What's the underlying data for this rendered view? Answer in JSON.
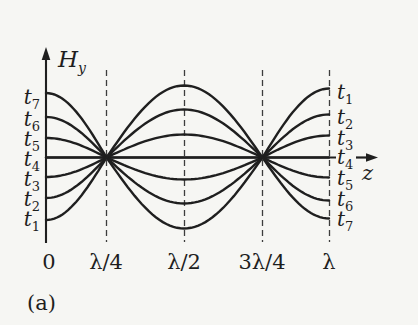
{
  "figure": {
    "panel_label": "(a)",
    "y_axis_label": {
      "base": "H",
      "sub": "y"
    },
    "x_axis_label": "z",
    "x_ticks": [
      {
        "label": "0",
        "x_px": 49
      },
      {
        "label": "λ/4",
        "x_px": 106
      },
      {
        "label": "λ/2",
        "x_px": 184
      },
      {
        "label": "3λ/4",
        "x_px": 262
      },
      {
        "label": "λ",
        "x_px": 329
      }
    ],
    "left_time_labels": [
      {
        "base": "t",
        "sub": "7",
        "y_px": 97
      },
      {
        "base": "t",
        "sub": "6",
        "y_px": 119
      },
      {
        "base": "t",
        "sub": "5",
        "y_px": 139
      },
      {
        "base": "t",
        "sub": "4",
        "y_px": 159
      },
      {
        "base": "t",
        "sub": "3",
        "y_px": 179
      },
      {
        "base": "t",
        "sub": "2",
        "y_px": 199
      },
      {
        "base": "t",
        "sub": "1",
        "y_px": 219
      }
    ],
    "right_time_labels": [
      {
        "base": "t",
        "sub": "1",
        "y_px": 92
      },
      {
        "base": "t",
        "sub": "2",
        "y_px": 117
      },
      {
        "base": "t",
        "sub": "3",
        "y_px": 138
      },
      {
        "base": "t",
        "sub": "4",
        "y_px": 157
      },
      {
        "base": "t",
        "sub": "5",
        "y_px": 178
      },
      {
        "base": "t",
        "sub": "6",
        "y_px": 199
      },
      {
        "base": "t",
        "sub": "7",
        "y_px": 219
      }
    ]
  },
  "chart_data": {
    "type": "line",
    "xlabel": "z",
    "ylabel": "Hy",
    "x_axis_ticks": [
      "0",
      "λ/4",
      "λ/2",
      "3λ/4",
      "λ"
    ],
    "node_positions": [
      "λ/4",
      "3λ/4"
    ],
    "antinode_positions": [
      "0",
      "λ/2",
      "λ"
    ],
    "waveform": "Hy(z,t_k) = A_k · cos(2πz/λ)",
    "grid": "dashed vertical lines at λ/4, λ/2, 3λ/4, λ",
    "series": [
      {
        "time_left": "t7",
        "time_right": "t1",
        "relative_amplitude_at_z0": 1.0,
        "amp_z0_px": 64.5,
        "amp_mid_px": -71,
        "amp_end_px": 69
      },
      {
        "time_left": "t6",
        "time_right": "t2",
        "relative_amplitude_at_z0": 0.63,
        "amp_z0_px": 40.5,
        "amp_mid_px": -46,
        "amp_end_px": 43
      },
      {
        "time_left": "t5",
        "time_right": "t3",
        "relative_amplitude_at_z0": 0.3,
        "amp_z0_px": 19.5,
        "amp_mid_px": -22,
        "amp_end_px": 22
      },
      {
        "time_left": "t4",
        "time_right": "t4",
        "relative_amplitude_at_z0": 0,
        "amp_z0_px": 0,
        "amp_mid_px": 0,
        "amp_end_px": 0
      },
      {
        "time_left": "t3",
        "time_right": "t5",
        "relative_amplitude_at_z0": -0.3,
        "amp_z0_px": -19.5,
        "amp_mid_px": 23,
        "amp_end_px": -20
      },
      {
        "time_left": "t2",
        "time_right": "t6",
        "relative_amplitude_at_z0": -0.63,
        "amp_z0_px": -40.5,
        "amp_mid_px": 48,
        "amp_end_px": -43
      },
      {
        "time_left": "t1",
        "time_right": "t7",
        "relative_amplitude_at_z0": -1.0,
        "amp_z0_px": -62.5,
        "amp_mid_px": 72,
        "amp_end_px": -61
      }
    ],
    "pixel_geometry": {
      "axis_x": 46,
      "axis_y": 157.5,
      "x_start": 46,
      "node1": 106.5,
      "mid": 184,
      "node2": 262.5,
      "x_end": 329,
      "dash_top": 70,
      "dash_bottom": 242,
      "y_axis_top": 56,
      "y_axis_bottom": 243,
      "x_axis_seg1_end": 336,
      "x_axis_seg2_start": 356,
      "x_axis_seg2_end": 368,
      "x_arrow_tip": 378,
      "y_arrow_tip": 47
    },
    "colors": {
      "ink": "#1f1f1f",
      "dash": "#3d3d3d",
      "background": "#f6f6f3"
    }
  }
}
